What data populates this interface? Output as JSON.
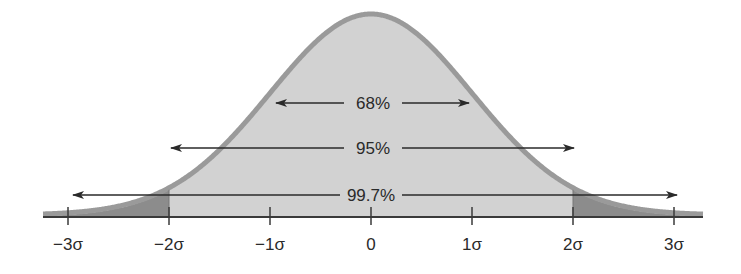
{
  "chart_data": {
    "type": "area",
    "title": "",
    "subtitle": "",
    "xlabel": "",
    "ylabel": "",
    "x_ticks": [
      -3,
      -2,
      -1,
      0,
      1,
      2,
      3
    ],
    "tick_labels": [
      "−3σ",
      "−2σ",
      "−1σ",
      "0",
      "1σ",
      "2σ",
      "3σ"
    ],
    "xlim": [
      -3.0,
      3.3
    ],
    "grid": false,
    "legend": null,
    "intervals": [
      {
        "label": "68%",
        "from": -1,
        "to": 1,
        "value": 68
      },
      {
        "label": "95%",
        "from": -2,
        "to": 2,
        "value": 95
      },
      {
        "label": "99.7%",
        "from": -3,
        "to": 3,
        "value": 99.7
      }
    ],
    "shaded_regions": [
      {
        "from": -2,
        "to": 2,
        "shade": "light"
      },
      {
        "from": -3.3,
        "to": -2,
        "shade": "dark"
      },
      {
        "from": 2,
        "to": 3.3,
        "shade": "dark"
      }
    ]
  },
  "labels": {
    "ticks": [
      "−3σ",
      "−2σ",
      "−1σ",
      "0",
      "1σ",
      "2σ",
      "3σ"
    ],
    "interval_68": "68%",
    "interval_95": "95%",
    "interval_997": "99.7%"
  },
  "colors": {
    "curve_outline": "#9a9a9a",
    "fill_light": "#d2d2d2",
    "fill_dark": "#8c8c8c",
    "axis": "#3a3a3a",
    "text": "#2a2a2a"
  }
}
